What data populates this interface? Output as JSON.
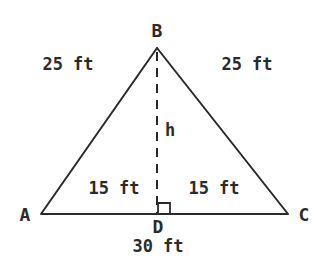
{
  "diagram": {
    "type": "isosceles-triangle-with-altitude",
    "colors": {
      "stroke": "#2a2a2a",
      "text": "#2b2b2b",
      "background": "#ffffff"
    },
    "vertices": {
      "A": {
        "label": "A",
        "x": 41,
        "y": 214
      },
      "B": {
        "label": "B",
        "x": 157,
        "y": 48
      },
      "C": {
        "label": "C",
        "x": 288,
        "y": 214
      },
      "D": {
        "label": "D",
        "x": 158,
        "y": 214
      }
    },
    "labels": {
      "side_AB": "25 ft",
      "side_BC": "25 ft",
      "segment_AD": "15 ft",
      "segment_DC": "15 ft",
      "base_AC": "30 ft",
      "height": "h"
    }
  }
}
